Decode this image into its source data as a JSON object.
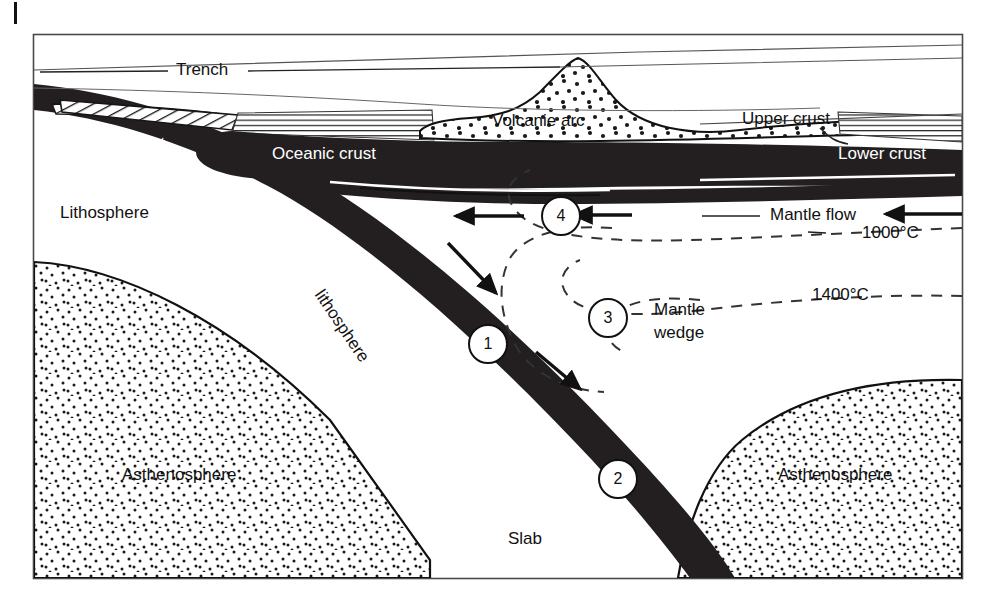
{
  "figure": {
    "frame": {
      "stroke": "#3a3a3a"
    },
    "margin_tick": {
      "name": "page-margin-tick"
    }
  },
  "colors": {
    "slab_dark": "#231f20",
    "crust_dark": "#231f20",
    "line": "#111111",
    "frame": "#4a4a4a",
    "stipple": "#1a1a1a",
    "white": "#ffffff",
    "isotherm": "#333333"
  },
  "labels": {
    "trench": "Trench",
    "oceanic_crust_left": "Oceanic crust",
    "oceanic_crust_right": "Oceanic crust",
    "volcanic_arc": "Volcanie arc",
    "upper_crust": "Upper crust",
    "lower_crust": "Lower crust",
    "lithosphere": "Lithosphere",
    "subducted": "Subducted",
    "subducted_line2": "lithosphere",
    "mantle_flow": "Mantle flow",
    "mantle_wedge_line1": "Mantle",
    "mantle_wedge_line2": "wedge",
    "asthenosphere_left": "Asthenosphere",
    "asthenosphere_right": "Asthenosphere",
    "slab": "Slab"
  },
  "isotherms": [
    {
      "id": "isotherm-1000",
      "label": "1000°C",
      "value": 1000,
      "unit": "°C"
    },
    {
      "id": "isotherm-1400",
      "label": "1400°C",
      "value": 1400,
      "unit": "°C"
    }
  ],
  "callouts": [
    {
      "id": "callout-1",
      "label": "1"
    },
    {
      "id": "callout-2",
      "label": "2"
    },
    {
      "id": "callout-3",
      "label": "3"
    },
    {
      "id": "callout-4",
      "label": "4"
    }
  ],
  "arrows": [
    {
      "id": "arrow-mantle-flow-outer",
      "direction": "left"
    },
    {
      "id": "arrow-mantle-flow-inner",
      "direction": "left"
    },
    {
      "id": "arrow-corner-flow-down",
      "direction": "down-right"
    },
    {
      "id": "arrow-slab-entrainment",
      "direction": "down-right"
    }
  ]
}
